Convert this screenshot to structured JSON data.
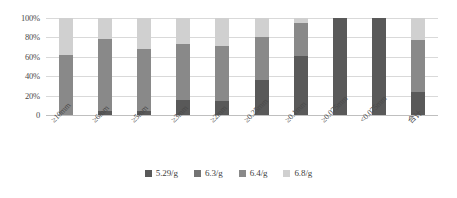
{
  "chart_data": {
    "type": "bar",
    "stacked": true,
    "normalized_percent": true,
    "title": "",
    "subtitle": "",
    "xlabel": "",
    "ylabel": "",
    "ylim": [
      0,
      100
    ],
    "grid": true,
    "legend_position": "bottom",
    "categories": [
      "≥10mm",
      "≥6mm",
      "≥5mm",
      "≥3mm",
      "≥2mm",
      "≥0.25mm",
      "≥0.1mm",
      "≥0.075mm",
      "<0.075mm",
      "合计"
    ],
    "y_ticks": [
      "0",
      "20%",
      "40%",
      "60%",
      "80%",
      "100%"
    ],
    "y_tick_values": [
      0,
      20,
      40,
      60,
      80,
      100
    ],
    "series": [
      {
        "name": "5.29/g",
        "color": "#595959",
        "values": [
          0,
          4,
          4,
          15,
          14,
          36,
          61,
          100,
          100,
          24
        ]
      },
      {
        "name": "6.3/g",
        "color": "#7f7f7f",
        "values": [
          0,
          0,
          0,
          0,
          0,
          0,
          0,
          0,
          0,
          0
        ]
      },
      {
        "name": "6.4/g",
        "color": "#898989",
        "values": [
          62,
          74,
          64,
          58,
          57,
          44,
          34,
          0,
          0,
          53
        ]
      },
      {
        "name": "6.8/g",
        "color": "#d0d0d0",
        "values": [
          38,
          22,
          32,
          27,
          29,
          20,
          5,
          0,
          0,
          23
        ]
      }
    ]
  },
  "legend": {
    "items": [
      {
        "label": "5.29/g",
        "color": "#595959"
      },
      {
        "label": "6.3/g",
        "color": "#737373"
      },
      {
        "label": "6.4/g",
        "color": "#898989"
      },
      {
        "label": "6.8/g",
        "color": "#d0d0d0"
      }
    ]
  },
  "axes": {
    "y_ticks": [
      "100%",
      "80%",
      "60%",
      "40%",
      "20%",
      "0"
    ],
    "x_ticks": [
      "≥10mm",
      "≥6mm",
      "≥5mm",
      "≥3mm",
      "≥2mm",
      "≥0.25mm",
      "≥0.1mm",
      "≥0.075mm",
      "<0.075mm",
      "合计"
    ]
  },
  "colors": {
    "gridline": "#d9d9d9",
    "axis": "#bfbfbf",
    "text": "#4a4a4a",
    "background": "#ffffff"
  }
}
